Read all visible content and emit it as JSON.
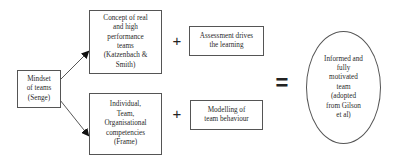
{
  "diagram": {
    "source_box": {
      "label": "Mindset\nof teams\n(Senge)"
    },
    "branches": [
      {
        "concept_box": {
          "label": "Concept of real\nand high\nperformance\nteams\n(Katzenbach &\nSmith)"
        },
        "operator": "+",
        "addend_box": {
          "label": "Assessment drives\nthe learning"
        }
      },
      {
        "concept_box": {
          "label": "Individual,\nTeam,\nOrganisational\ncompetencies\n(Frame)"
        },
        "operator": "+",
        "addend_box": {
          "label": "Modelling of\nteam behaviour"
        }
      }
    ],
    "equals_operator": "=",
    "result_ellipse": {
      "label": "Informed and\nfully\nmotivated\nteam\n(adopted\nfrom Gilson\net al)"
    },
    "colors": {
      "stroke": "#555555",
      "text": "#2a2a2a",
      "background": "#ffffff"
    }
  }
}
